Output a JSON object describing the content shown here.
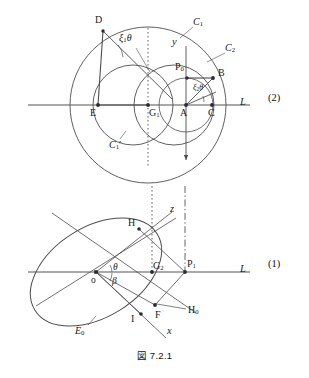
{
  "figure": {
    "caption": "図 7.2.1",
    "section_labels": [
      {
        "text": "(2)",
        "x": 270,
        "y": 97
      },
      {
        "text": "(1)",
        "x": 270,
        "y": 262
      }
    ]
  },
  "panel_top": {
    "id": "(2)",
    "axis_label_L": "L",
    "axis_label_y": "y",
    "curve_labels": [
      {
        "name": "C1",
        "base": "C",
        "sub": "1",
        "prime": "",
        "x": 196,
        "y": 22
      },
      {
        "name": "C2",
        "base": "C",
        "sub": "2",
        "prime": "",
        "x": 228,
        "y": 48
      },
      {
        "name": "C1p",
        "base": "C",
        "sub": "1",
        "prime": "′",
        "x": 112,
        "y": 145
      }
    ],
    "points": [
      {
        "name": "D",
        "label": "D",
        "x": 103,
        "y": 29,
        "lx": 98,
        "ly": 20
      },
      {
        "name": "E",
        "label": "E",
        "x": 98,
        "y": 105,
        "lx": 92,
        "ly": 113
      },
      {
        "name": "G1",
        "label": "G",
        "sub": "1",
        "x": 148,
        "y": 105,
        "lx": 150,
        "ly": 113
      },
      {
        "name": "A",
        "label": "A",
        "x": 186,
        "y": 105,
        "lx": 182,
        "ly": 113
      },
      {
        "name": "C",
        "label": "C",
        "x": 212,
        "y": 105,
        "lx": 210,
        "ly": 113
      },
      {
        "name": "B",
        "label": "B",
        "x": 213,
        "y": 78,
        "lx": 219,
        "ly": 71
      },
      {
        "name": "P0",
        "label": "P",
        "sub": "0",
        "x": 187,
        "y": 78,
        "lx": 178,
        "ly": 66
      }
    ],
    "angles": [
      {
        "name": "xi1-theta",
        "base": "ξ",
        "sub": "1",
        "theta": "θ",
        "x": 124,
        "y": 40
      },
      {
        "name": "xi2-theta",
        "base": "ξ",
        "sub": "2",
        "theta": "θ",
        "x": 196,
        "y": 90
      }
    ]
  },
  "panel_bottom": {
    "id": "(1)",
    "axis_label_L": "L",
    "axis_label_x": "x",
    "axis_label_z": "z",
    "curve_labels": [
      {
        "name": "E0",
        "base": "E",
        "sub": "0",
        "x": 79,
        "y": 331
      }
    ],
    "points": [
      {
        "name": "o",
        "label": "o",
        "x": 96,
        "y": 272,
        "lx": 93,
        "ly": 280
      },
      {
        "name": "G2",
        "label": "G",
        "sub": "2",
        "x": 152,
        "y": 272,
        "lx": 153,
        "ly": 266
      },
      {
        "name": "P1",
        "label": "P",
        "sub": "1",
        "x": 185,
        "y": 272,
        "lx": 186,
        "ly": 264
      },
      {
        "name": "H",
        "label": "H",
        "x": 139,
        "y": 229,
        "lx": 131,
        "ly": 222
      },
      {
        "name": "I",
        "label": "I",
        "x": 141,
        "y": 314,
        "lx": 134,
        "ly": 320
      },
      {
        "name": "F",
        "label": "F",
        "x": 155,
        "y": 305,
        "lx": 157,
        "ly": 316
      },
      {
        "name": "H0",
        "label": "H",
        "sub": "0",
        "x": 190,
        "y": 312,
        "lx": 187,
        "ly": 312
      }
    ],
    "angles": [
      {
        "name": "theta",
        "theta": "θ",
        "x": 115,
        "y": 269
      },
      {
        "name": "beta",
        "theta": "β",
        "x": 114,
        "y": 283
      }
    ]
  },
  "style": {
    "stroke": "#4d4d4d",
    "stroke_dark": "#333333",
    "axis": "#555555",
    "point_fill": "#2b2b2b"
  }
}
